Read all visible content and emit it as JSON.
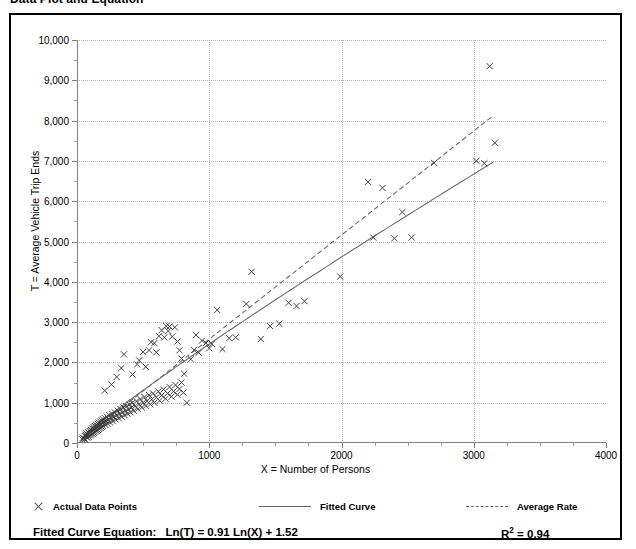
{
  "title": "Data Plot and Equation",
  "axis": {
    "y_title": "T = Average Vehicle Trip Ends",
    "x_title": "X = Number of Persons"
  },
  "legend": {
    "items": [
      {
        "label": "Actual Data Points",
        "marker": "cross-marker-icon"
      },
      {
        "label": "Fitted Curve",
        "marker": "solid-line-icon"
      },
      {
        "label": "Average Rate",
        "marker": "dashed-line-icon"
      }
    ]
  },
  "footer": {
    "equation_label": "Fitted Curve Equation:",
    "equation": "Ln(T) = 0.91 Ln(X) + 1.52",
    "r_squared_label": "R",
    "r_squared_sup": "2",
    "r_squared_value": " = 0.94"
  },
  "colors": {
    "frame": "#000000",
    "grid": "#b9b9b9",
    "axis": "#808080",
    "marker": "#3b3b3b",
    "fitted_curve": "#6f6f6f",
    "average_rate": "#6f6f6f"
  },
  "chart_data": {
    "type": "scatter",
    "title": "Data Plot and Equation",
    "xlabel": "X = Number of Persons",
    "ylabel": "T = Average Vehicle Trip Ends",
    "xlim": [
      0,
      4000
    ],
    "ylim": [
      0,
      10000
    ],
    "xticks": [
      0,
      1000,
      2000,
      3000,
      4000
    ],
    "xtick_labels": [
      "0",
      "1000",
      "2000",
      "3000",
      "4000"
    ],
    "x_minor_step": 250,
    "yticks": [
      0,
      1000,
      2000,
      3000,
      4000,
      5000,
      6000,
      7000,
      8000,
      9000,
      10000
    ],
    "ytick_labels": [
      "0",
      "1,000",
      "2,000",
      "3,000",
      "4,000",
      "5,000",
      "6,000",
      "7,000",
      "8,000",
      "9,000",
      "10,000"
    ],
    "y_minor_step": 500,
    "grid": "dotted-both-axes",
    "legend_position": "below-plot",
    "series": [
      {
        "name": "Actual Data Points",
        "type": "scatter",
        "marker": "x",
        "points": [
          [
            40,
            90
          ],
          [
            45,
            130
          ],
          [
            52,
            110
          ],
          [
            58,
            175
          ],
          [
            60,
            95
          ],
          [
            65,
            205
          ],
          [
            70,
            160
          ],
          [
            72,
            240
          ],
          [
            78,
            130
          ],
          [
            80,
            200
          ],
          [
            85,
            265
          ],
          [
            88,
            150
          ],
          [
            92,
            230
          ],
          [
            95,
            300
          ],
          [
            98,
            185
          ],
          [
            102,
            255
          ],
          [
            105,
            330
          ],
          [
            108,
            205
          ],
          [
            112,
            290
          ],
          [
            115,
            360
          ],
          [
            118,
            230
          ],
          [
            122,
            310
          ],
          [
            125,
            395
          ],
          [
            128,
            255
          ],
          [
            132,
            340
          ],
          [
            135,
            420
          ],
          [
            138,
            275
          ],
          [
            142,
            365
          ],
          [
            145,
            450
          ],
          [
            148,
            300
          ],
          [
            152,
            390
          ],
          [
            155,
            480
          ],
          [
            158,
            325
          ],
          [
            162,
            415
          ],
          [
            165,
            505
          ],
          [
            168,
            350
          ],
          [
            172,
            440
          ],
          [
            175,
            535
          ],
          [
            178,
            375
          ],
          [
            182,
            465
          ],
          [
            185,
            560
          ],
          [
            188,
            400
          ],
          [
            192,
            495
          ],
          [
            195,
            590
          ],
          [
            198,
            425
          ],
          [
            205,
            520
          ],
          [
            210,
            620
          ],
          [
            215,
            450
          ],
          [
            220,
            550
          ],
          [
            225,
            655
          ],
          [
            230,
            480
          ],
          [
            238,
            580
          ],
          [
            245,
            690
          ],
          [
            250,
            510
          ],
          [
            258,
            615
          ],
          [
            265,
            725
          ],
          [
            270,
            545
          ],
          [
            278,
            650
          ],
          [
            285,
            760
          ],
          [
            292,
            580
          ],
          [
            300,
            690
          ],
          [
            308,
            800
          ],
          [
            315,
            615
          ],
          [
            322,
            725
          ],
          [
            330,
            840
          ],
          [
            338,
            650
          ],
          [
            345,
            760
          ],
          [
            352,
            880
          ],
          [
            360,
            690
          ],
          [
            368,
            800
          ],
          [
            375,
            915
          ],
          [
            382,
            725
          ],
          [
            390,
            840
          ],
          [
            398,
            960
          ],
          [
            405,
            760
          ],
          [
            412,
            880
          ],
          [
            420,
            1000
          ],
          [
            430,
            800
          ],
          [
            440,
            915
          ],
          [
            450,
            1040
          ],
          [
            460,
            845
          ],
          [
            470,
            960
          ],
          [
            480,
            1090
          ],
          [
            490,
            880
          ],
          [
            500,
            1000
          ],
          [
            510,
            1140
          ],
          [
            520,
            920
          ],
          [
            530,
            1040
          ],
          [
            545,
            1190
          ],
          [
            555,
            960
          ],
          [
            565,
            1080
          ],
          [
            575,
            1230
          ],
          [
            585,
            1000
          ],
          [
            600,
            1130
          ],
          [
            615,
            1280
          ],
          [
            625,
            1050
          ],
          [
            640,
            1180
          ],
          [
            655,
            1330
          ],
          [
            670,
            1100
          ],
          [
            685,
            1230
          ],
          [
            700,
            1390
          ],
          [
            715,
            1150
          ],
          [
            730,
            1280
          ],
          [
            745,
            1440
          ],
          [
            760,
            1200
          ],
          [
            775,
            1340
          ],
          [
            790,
            1500
          ],
          [
            805,
            1250
          ],
          [
            210,
            1300
          ],
          [
            260,
            1450
          ],
          [
            300,
            1640
          ],
          [
            335,
            1860
          ],
          [
            355,
            2200
          ],
          [
            420,
            1700
          ],
          [
            455,
            1950
          ],
          [
            470,
            2050
          ],
          [
            500,
            2260
          ],
          [
            520,
            1890
          ],
          [
            545,
            2300
          ],
          [
            560,
            2500
          ],
          [
            585,
            2480
          ],
          [
            600,
            2250
          ],
          [
            620,
            2650
          ],
          [
            640,
            2800
          ],
          [
            660,
            2620
          ],
          [
            675,
            2900
          ],
          [
            690,
            2780
          ],
          [
            700,
            2890
          ],
          [
            720,
            2640
          ],
          [
            740,
            2870
          ],
          [
            760,
            2520
          ],
          [
            775,
            2300
          ],
          [
            790,
            2100
          ],
          [
            810,
            1720
          ],
          [
            830,
            1000
          ],
          [
            860,
            2080
          ],
          [
            885,
            2310
          ],
          [
            900,
            2680
          ],
          [
            920,
            2240
          ],
          [
            945,
            2540
          ],
          [
            975,
            2480
          ],
          [
            1000,
            2350
          ],
          [
            1020,
            2460
          ],
          [
            1060,
            3300
          ],
          [
            1100,
            2330
          ],
          [
            1150,
            2600
          ],
          [
            1200,
            2620
          ],
          [
            1280,
            3450
          ],
          [
            1320,
            4250
          ],
          [
            1390,
            2580
          ],
          [
            1460,
            2900
          ],
          [
            1530,
            2960
          ],
          [
            1600,
            3480
          ],
          [
            1660,
            3400
          ],
          [
            1720,
            3520
          ],
          [
            1990,
            4130
          ],
          [
            2200,
            6480
          ],
          [
            2240,
            5100
          ],
          [
            2310,
            6330
          ],
          [
            2400,
            5080
          ],
          [
            2460,
            5730
          ],
          [
            2530,
            5100
          ],
          [
            2700,
            6950
          ],
          [
            3020,
            7000
          ],
          [
            3080,
            6940
          ],
          [
            3120,
            9350
          ],
          [
            3160,
            7450
          ]
        ]
      },
      {
        "name": "Fitted Curve",
        "type": "line",
        "style": "solid",
        "equation": "Ln(T) = 0.91 Ln(X) + 1.52",
        "r_squared": 0.94,
        "x_range": [
          60,
          3150
        ],
        "sample_points": [
          [
            60,
            179
          ],
          [
            150,
            413
          ],
          [
            300,
            776
          ],
          [
            500,
            1248
          ],
          [
            750,
            1817
          ],
          [
            1000,
            2371
          ],
          [
            1500,
            3448
          ],
          [
            2000,
            4500
          ],
          [
            2500,
            5534
          ],
          [
            3150,
            6855
          ]
        ]
      },
      {
        "name": "Average Rate",
        "type": "line",
        "style": "dashed",
        "x_range": [
          60,
          3150
        ],
        "sample_points": [
          [
            60,
            155
          ],
          [
            500,
            1290
          ],
          [
            1000,
            2580
          ],
          [
            1500,
            3870
          ],
          [
            2000,
            5160
          ],
          [
            2500,
            6450
          ],
          [
            3150,
            8130
          ]
        ]
      }
    ]
  }
}
